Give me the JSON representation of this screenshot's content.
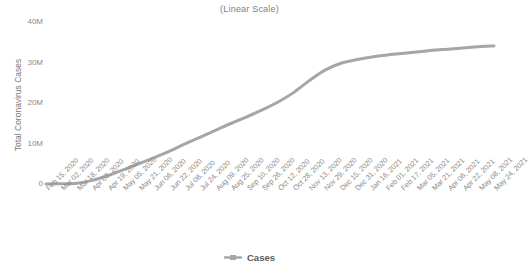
{
  "chart_data": {
    "type": "line",
    "title": "(Linear Scale)",
    "xlabel": "",
    "ylabel": "Total Coronavirus Cases",
    "ylim": [
      0,
      40000000
    ],
    "grid": false,
    "legend_position": "bottom",
    "legend": [
      "Cases"
    ],
    "y_ticks": [
      0,
      10000000,
      20000000,
      30000000,
      40000000
    ],
    "y_tick_labels": [
      "0",
      "10M",
      "20M",
      "30M",
      "40M"
    ],
    "line_color": "#a6a6a6",
    "series": [
      {
        "name": "Cases",
        "values": [
          0,
          60000,
          180000,
          900000,
          2100000,
          3500000,
          5000000,
          6500000,
          8100000,
          9900000,
          11600000,
          13300000,
          15000000,
          16600000,
          18300000,
          20200000,
          22500000,
          25400000,
          28000000,
          29700000,
          30600000,
          31300000,
          31800000,
          32200000,
          32600000,
          33000000,
          33300000,
          33600000,
          33900000,
          34100000
        ]
      }
    ],
    "categories": [
      "Feb 15, 2020",
      "Mar 02, 2020",
      "Mar 18, 2020",
      "Apr 03, 2020",
      "Apr 19, 2020",
      "May 05, 2020",
      "May 21, 2020",
      "Jun 06, 2020",
      "Jun 22, 2020",
      "Jul 08, 2020",
      "Jul 24, 2020",
      "Aug 09, 2020",
      "Aug 25, 2020",
      "Sep 10, 2020",
      "Sep 26, 2020",
      "Oct 12, 2020",
      "Oct 28, 2020",
      "Nov 13, 2020",
      "Nov 29, 2020",
      "Dec 15, 2020",
      "Dec 31, 2020",
      "Jan 16, 2021",
      "Feb 01, 2021",
      "Feb 17, 2021",
      "Mar 05, 2021",
      "Mar 21, 2021",
      "Apr 06, 2021",
      "Apr 22, 2021",
      "May 08, 2021",
      "May 24, 2021"
    ]
  }
}
